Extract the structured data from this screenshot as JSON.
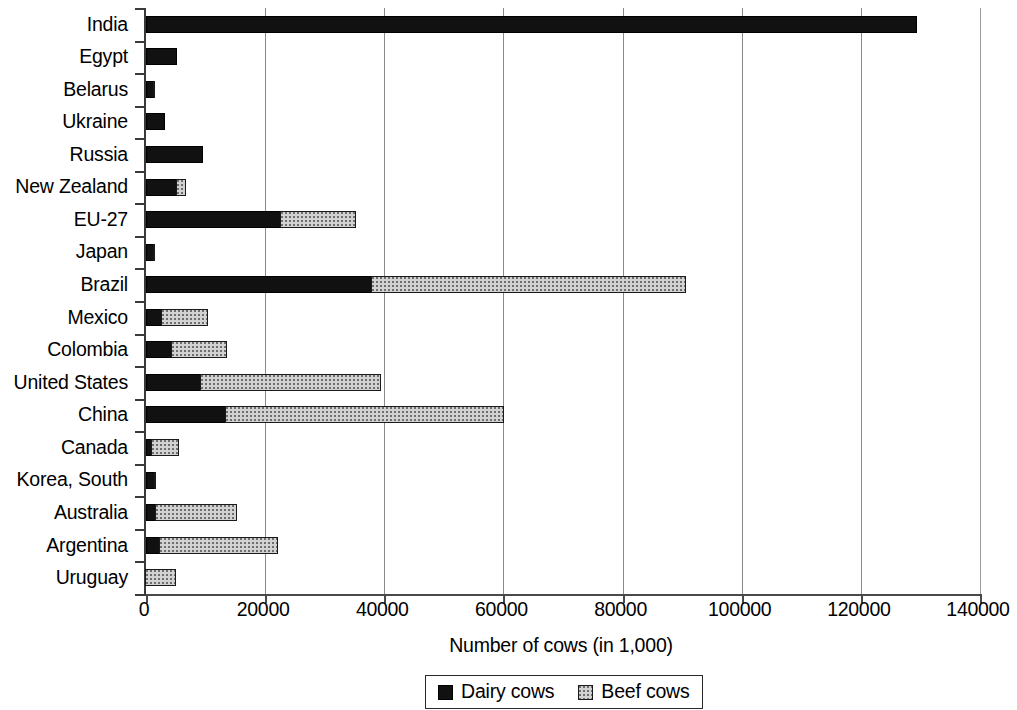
{
  "chart_data": {
    "type": "bar",
    "orientation": "horizontal",
    "stacked": true,
    "title": "",
    "xlabel": "Number of cows (in 1,000)",
    "ylabel": "",
    "xlim": [
      0,
      140000
    ],
    "xticks": [
      0,
      20000,
      40000,
      60000,
      80000,
      100000,
      120000,
      140000
    ],
    "xtick_labels": [
      "0",
      "20000",
      "40000",
      "60000",
      "80000",
      "100000",
      "120000",
      "140000"
    ],
    "grid": "vertical",
    "legend_position": "bottom",
    "categories": [
      "India",
      "Egypt",
      "Belarus",
      "Ukraine",
      "Russia",
      "New Zealand",
      "EU-27",
      "Japan",
      "Brazil",
      "Mexico",
      "Colombia",
      "United States",
      "China",
      "Canada",
      "Korea, South",
      "Australia",
      "Argentina",
      "Uruguay"
    ],
    "series": [
      {
        "name": "Dairy cows",
        "color": "#111111",
        "values": [
          129500,
          5200,
          1400,
          3200,
          9500,
          5200,
          22600,
          1400,
          38000,
          2700,
          4400,
          9300,
          13500,
          960,
          1500,
          1700,
          2300,
          0
        ]
      },
      {
        "name": "Beef cows",
        "color": "#d2d2d2",
        "values": [
          0,
          0,
          200,
          0,
          0,
          1600,
          12800,
          300,
          52800,
          7800,
          9300,
          30300,
          46800,
          4700,
          400,
          13700,
          20100,
          5200
        ]
      }
    ],
    "totals": [
      129500,
      5200,
      1600,
      3200,
      9500,
      6800,
      35400,
      1700,
      90800,
      10500,
      13700,
      39600,
      60300,
      5660,
      1900,
      15400,
      22400,
      5200
    ]
  },
  "legend": {
    "items": [
      {
        "label": "Dairy cows",
        "swatch": "dairy-swatch"
      },
      {
        "label": "Beef cows",
        "swatch": "beef-swatch"
      }
    ]
  }
}
